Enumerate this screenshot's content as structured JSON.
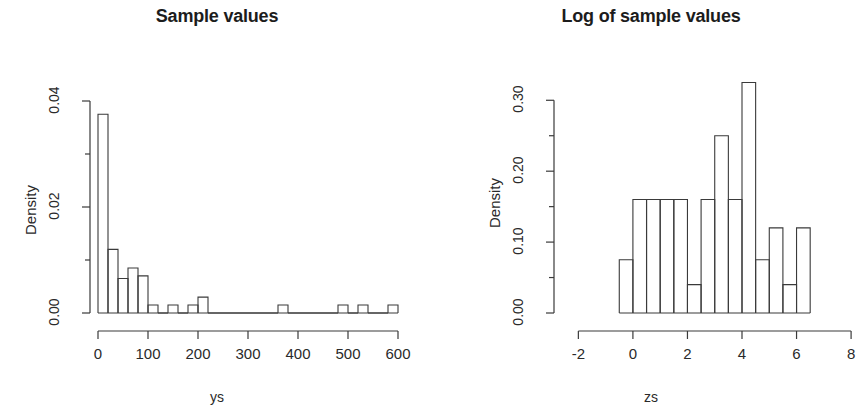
{
  "figure": {
    "background": "#ffffff",
    "foreground": "#2a2a2a",
    "panel_count": 2
  },
  "chart_data": [
    {
      "type": "bar",
      "subtype": "histogram",
      "panel": "left",
      "title": "Sample values",
      "xlabel": "ys",
      "ylabel": "Density",
      "xlim": [
        0,
        620
      ],
      "ylim": [
        0,
        0.04
      ],
      "grid": false,
      "legend": null,
      "xticks": [
        0,
        100,
        200,
        300,
        400,
        500,
        600
      ],
      "xtick_labels": [
        "0",
        "100",
        "200",
        "300",
        "400",
        "500",
        "600"
      ],
      "yticks": [
        0.0,
        0.01,
        0.02,
        0.03,
        0.04
      ],
      "ytick_labels": [
        "0.00",
        "",
        "0.02",
        "",
        "0.04"
      ],
      "ytick_labeled": [
        0.0,
        0.02,
        0.04
      ],
      "bin_width": 20,
      "bin_edges": [
        0,
        20,
        40,
        60,
        80,
        100,
        120,
        140,
        160,
        180,
        200,
        220,
        240,
        260,
        280,
        300,
        320,
        340,
        360,
        380,
        400,
        420,
        440,
        460,
        480,
        500,
        520,
        540,
        560,
        580,
        600
      ],
      "values": [
        0.0375,
        0.012,
        0.0065,
        0.0085,
        0.007,
        0.0015,
        0.0,
        0.0015,
        0.0,
        0.0015,
        0.003,
        0.0,
        0.0,
        0.0,
        0.0,
        0.0,
        0.0,
        0.0,
        0.0015,
        0.0,
        0.0,
        0.0,
        0.0,
        0.0,
        0.0015,
        0.0,
        0.0015,
        0.0,
        0.0,
        0.0015
      ]
    },
    {
      "type": "bar",
      "subtype": "histogram",
      "panel": "right",
      "title": "Log of sample values",
      "xlabel": "zs",
      "ylabel": "Density",
      "xlim": [
        -2.6,
        8.4
      ],
      "ylim": [
        0,
        0.33
      ],
      "grid": false,
      "legend": null,
      "xticks": [
        -2,
        0,
        2,
        4,
        6,
        8
      ],
      "xtick_labels": [
        "-2",
        "0",
        "2",
        "4",
        "6",
        "8"
      ],
      "yticks": [
        0.0,
        0.05,
        0.1,
        0.15,
        0.2,
        0.25,
        0.3
      ],
      "ytick_labels": [
        "0.00",
        "",
        "0.10",
        "",
        "0.20",
        "",
        "0.30"
      ],
      "ytick_labeled": [
        0.0,
        0.1,
        0.2,
        0.3
      ],
      "bin_width": 0.5,
      "bin_edges": [
        -0.5,
        0.0,
        0.5,
        1.0,
        1.5,
        2.0,
        2.5,
        3.0,
        3.5,
        4.0,
        4.5,
        5.0,
        5.5,
        6.0,
        6.5
      ],
      "values": [
        0.075,
        0.16,
        0.16,
        0.16,
        0.16,
        0.04,
        0.16,
        0.25,
        0.16,
        0.325,
        0.075,
        0.12,
        0.04,
        0.12
      ]
    }
  ]
}
